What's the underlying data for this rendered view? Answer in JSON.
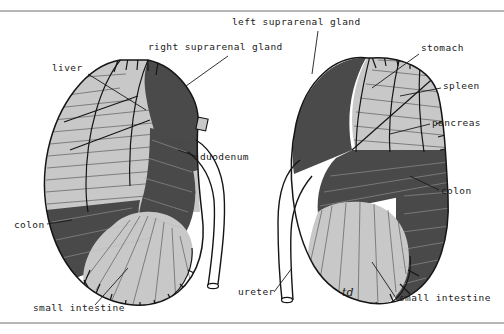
{
  "figure": {
    "background_color": "#ffffff",
    "ink_color": "#151515",
    "fill_light": "#c8c8c8",
    "fill_dark": "#4a4a4a",
    "fill_white": "#ffffff",
    "rule_color": "#6f6f6f"
  },
  "left_panel": {
    "name": "right-kidney-anterior-relations",
    "labels": [
      {
        "id": "liver",
        "text": "liver",
        "x": 52,
        "y": 71
      },
      {
        "id": "right-suprarenal",
        "text": "right suprarenal gland",
        "x": 148,
        "y": 50
      },
      {
        "id": "duodenum",
        "text": "duodenum",
        "x": 200,
        "y": 160
      },
      {
        "id": "colon-left",
        "text": "colon",
        "x": 14,
        "y": 228
      },
      {
        "id": "small-intestine-left",
        "text": "small intestine",
        "x": 33,
        "y": 311
      }
    ]
  },
  "right_panel": {
    "name": "left-kidney-anterior-relations",
    "labels": [
      {
        "id": "left-suprarenal",
        "text": "left suprarenal gland",
        "x": 232,
        "y": 25
      },
      {
        "id": "stomach",
        "text": "stomach",
        "x": 421,
        "y": 51
      },
      {
        "id": "spleen",
        "text": "spleen",
        "x": 443,
        "y": 89
      },
      {
        "id": "pancreas",
        "text": "pancreas",
        "x": 432,
        "y": 126
      },
      {
        "id": "colon-right",
        "text": "colon",
        "x": 441,
        "y": 194
      },
      {
        "id": "ureter",
        "text": "ureter",
        "x": 238,
        "y": 295
      },
      {
        "id": "annotation-td",
        "text": "td",
        "x": 342,
        "y": 296
      },
      {
        "id": "small-intestine-right",
        "text": "small intestine",
        "x": 399,
        "y": 301
      }
    ]
  }
}
